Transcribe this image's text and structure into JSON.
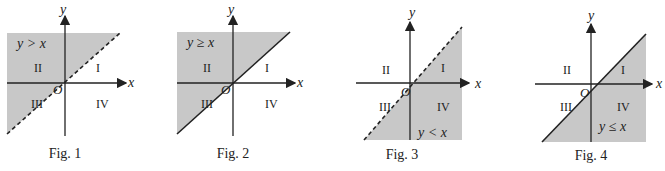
{
  "colors": {
    "shade": "#c8c8c8",
    "axis": "#222222",
    "text": "#222222",
    "background": "#ffffff"
  },
  "axis_labels": {
    "x": "x",
    "y": "y",
    "origin": "O"
  },
  "quadrants": {
    "q1": "I",
    "q2": "II",
    "q3": "III",
    "q4": "IV"
  },
  "figures": [
    {
      "caption": "Fig. 1",
      "inequality": "y > x",
      "boundary": "dashed",
      "shaded_side": "upper-left"
    },
    {
      "caption": "Fig. 2",
      "inequality": "y ≥ x",
      "boundary": "solid",
      "shaded_side": "upper-left"
    },
    {
      "caption": "Fig. 3",
      "inequality": "y < x",
      "boundary": "dashed",
      "shaded_side": "lower-right"
    },
    {
      "caption": "Fig. 4",
      "inequality": "y ≤ x",
      "boundary": "solid",
      "shaded_side": "lower-right"
    }
  ]
}
